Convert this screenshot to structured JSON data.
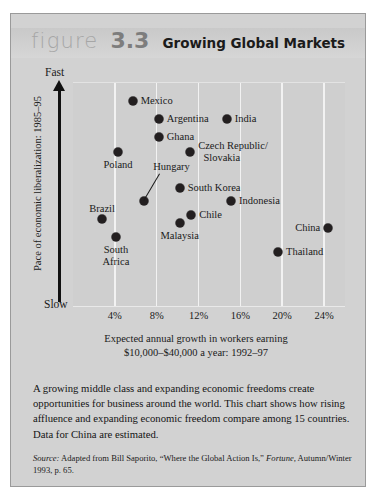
{
  "figure": {
    "word": "figure",
    "number": "3.3",
    "title": "Growing Global Markets"
  },
  "axes": {
    "y_title": "Pace of economic liberalization: 1985–95",
    "y_top_label": "Fast",
    "y_bottom_label": "Slow",
    "x_title_line1": "Expected annual growth in workers earning",
    "x_title_line2": "$10,000–$40,000 a year: 1992–97"
  },
  "caption": "A growing middle class and expanding economic freedoms create opportunities for business around the world. This chart shows how rising affluence and expanding economic freedom compare among 15 countries. Data for China are estimated.",
  "source": {
    "label": "Source:",
    "text_1": " Adapted from Bill Saporito, “Where the Global Action Is,” ",
    "italic_1": "Fortune,",
    "text_2": " Autumn/Winter 1993, p. 65."
  },
  "colors": {
    "figure_bg": "#d2d2d2",
    "plot_bg": "#cfcfcf",
    "gridline": "#f2f2f2",
    "dot": "#231f20",
    "number": "#7d7d7d",
    "figure_word": "#a6a6a6"
  },
  "chart_data": {
    "type": "scatter",
    "title": "Growing Global Markets",
    "xlabel": "Expected annual growth in workers earning $10,000–$40,000 a year: 1992–97",
    "ylabel": "Pace of economic liberalization: 1985–95",
    "xlim": [
      0,
      26
    ],
    "ylim": [
      0,
      100
    ],
    "grid": "vertical",
    "xticks": [
      "4%",
      "8%",
      "12%",
      "16%",
      "20%",
      "24%"
    ],
    "xtick_values": [
      4,
      8,
      12,
      16,
      20,
      24
    ],
    "ytick_labels": [
      "Slow",
      "Fast"
    ],
    "legend": "none",
    "points": [
      {
        "label": "Mexico",
        "x": 5.7,
        "y": 92,
        "label_pos": "right"
      },
      {
        "label": "Argentina",
        "x": 8.2,
        "y": 84,
        "label_pos": "right"
      },
      {
        "label": "India",
        "x": 14.7,
        "y": 84,
        "label_pos": "right"
      },
      {
        "label": "Ghana",
        "x": 8.2,
        "y": 76,
        "label_pos": "right"
      },
      {
        "label": "Poland",
        "x": 4.3,
        "y": 69,
        "label_pos": "below"
      },
      {
        "label": "Czech Republic/ Slovakia",
        "x": 11.2,
        "y": 69,
        "label_pos": "right"
      },
      {
        "label": "Hungary",
        "x": 6.8,
        "y": 47,
        "label_pos": "leader"
      },
      {
        "label": "South Korea",
        "x": 10.2,
        "y": 53,
        "label_pos": "right"
      },
      {
        "label": "Indonesia",
        "x": 15.1,
        "y": 47,
        "label_pos": "right"
      },
      {
        "label": "Brazil",
        "x": 2.8,
        "y": 39,
        "label_pos": "above-left"
      },
      {
        "label": "Chile",
        "x": 11.3,
        "y": 41,
        "label_pos": "right"
      },
      {
        "label": "China",
        "x": 24.4,
        "y": 35,
        "label_pos": "left"
      },
      {
        "label": "Malaysia",
        "x": 10.2,
        "y": 37,
        "label_pos": "below"
      },
      {
        "label": "South Africa",
        "x": 4.1,
        "y": 31,
        "label_pos": "below"
      },
      {
        "label": "Thailand",
        "x": 19.6,
        "y": 24,
        "label_pos": "right"
      }
    ]
  }
}
